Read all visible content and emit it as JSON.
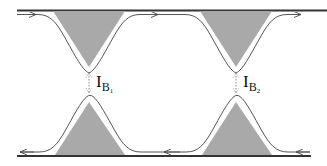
{
  "diagram": {
    "colors": {
      "gate_fill": "#a9a9a9",
      "edge_line": "#555555",
      "boundary_line": "#333333",
      "background": "#ffffff"
    },
    "labels": [
      {
        "id": "IB1",
        "main": "I",
        "sub": "B",
        "subsub": "1"
      },
      {
        "id": "IB2",
        "main": "I",
        "sub": "B",
        "subsub": "2"
      }
    ],
    "edges": [
      {
        "name": "top-edge",
        "direction": "left-to-right"
      },
      {
        "name": "bottom-edge",
        "direction": "right-to-left"
      }
    ],
    "gates": [
      {
        "name": "top-gate-1"
      },
      {
        "name": "top-gate-2"
      },
      {
        "name": "bottom-gate-1"
      },
      {
        "name": "bottom-gate-2"
      }
    ]
  }
}
